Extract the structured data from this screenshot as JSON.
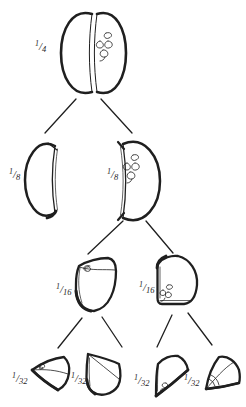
{
  "page": {
    "background": "#ffffff",
    "ink": "#1f1f1f"
  },
  "diagram": {
    "type": "binary-tree",
    "slash": "/",
    "nodes": [
      {
        "id": "quarter",
        "label": "1/4",
        "num": "1",
        "den": "4",
        "row": 0,
        "illustration": "two halves side by side with core squiggle"
      },
      {
        "id": "eighth-left",
        "label": "1/8",
        "num": "1",
        "den": "8",
        "row": 1,
        "illustration": "half piece, outside view"
      },
      {
        "id": "eighth-right",
        "label": "1/8",
        "num": "1",
        "den": "8",
        "row": 1,
        "illustration": "half piece, cut face with core squiggle"
      },
      {
        "id": "sixteenth-left",
        "label": "1/16",
        "num": "1",
        "den": "16",
        "row": 2,
        "illustration": "quarter piece, core curl on top face"
      },
      {
        "id": "sixteenth-right",
        "label": "1/16",
        "num": "1",
        "den": "16",
        "row": 2,
        "illustration": "quarter piece, core curls at base"
      },
      {
        "id": "thirtysecond-1",
        "label": "1/32",
        "num": "1",
        "den": "32",
        "row": 3,
        "illustration": "wedge pointing left with core curl"
      },
      {
        "id": "thirtysecond-2",
        "label": "1/32",
        "num": "1",
        "den": "32",
        "row": 3,
        "illustration": "wedge pointing up with diagonal cut line"
      },
      {
        "id": "thirtysecond-3",
        "label": "1/32",
        "num": "1",
        "den": "32",
        "row": 3,
        "illustration": "fan wedge with core curls at point"
      },
      {
        "id": "thirtysecond-4",
        "label": "1/32",
        "num": "1",
        "den": "32",
        "row": 3,
        "illustration": "fan wedge with angle arcs at point"
      }
    ],
    "edges": [
      {
        "from": "quarter",
        "to": "eighth-left"
      },
      {
        "from": "quarter",
        "to": "eighth-right"
      },
      {
        "from": "eighth-right",
        "to": "sixteenth-left"
      },
      {
        "from": "eighth-right",
        "to": "sixteenth-right"
      },
      {
        "from": "sixteenth-left",
        "to": "thirtysecond-1"
      },
      {
        "from": "sixteenth-left",
        "to": "thirtysecond-2"
      },
      {
        "from": "sixteenth-right",
        "to": "thirtysecond-3"
      },
      {
        "from": "sixteenth-right",
        "to": "thirtysecond-4"
      }
    ]
  }
}
